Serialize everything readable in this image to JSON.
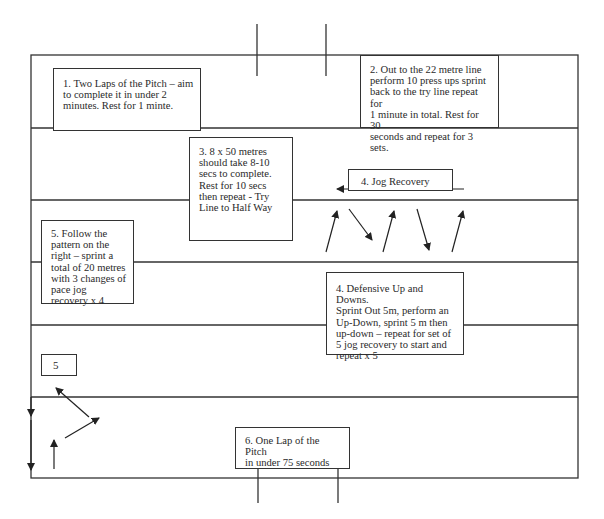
{
  "diagram": {
    "colors": {
      "line": "#333333",
      "background": "#ffffff",
      "text": "#2a2a2a"
    },
    "stations": [
      {
        "id": 1,
        "text": "1. Two Laps of the Pitch – aim\nto complete it in under 2\nminutes. Rest for 1 minte."
      },
      {
        "id": 2,
        "text": "2. Out to the 22 metre line\nperform 10 press ups sprint\nback to the try line repeat for\n1 minute in total. Rest for 30\nseconds and repeat for 3\nsets."
      },
      {
        "id": 3,
        "text": "3. 8  x 50 metres\nshould take 8-10\nsecs to complete.\nRest for 10 secs\nthen repeat  - Try\nLine to Half Way"
      },
      {
        "id": 4,
        "text": "4. Jog Recovery"
      },
      {
        "id": 5,
        "text": "5. Follow the\npattern on the\nright – sprint a\ntotal of 20 metres\nwith 3 changes of\npace jog\nrecovery x 4"
      },
      {
        "id": 6,
        "text": "4. Defensive Up and Downs.\nSprint Out 5m, perform an\nUp-Down, sprint 5 m then\nup-down – repeat for set of\n5 jog recovery to start and\nrepeat x 5"
      },
      {
        "id": 7,
        "text": "5"
      },
      {
        "id": 8,
        "text": "6. One Lap of the Pitch\nin under 75 seconds"
      }
    ],
    "pitch": {
      "outline": {
        "x": 31,
        "y": 55,
        "width": 547,
        "height": 423
      },
      "horizontal_lines_y": [
        128,
        200,
        262,
        325,
        397
      ],
      "goal_posts_top_x": [
        257,
        326
      ],
      "goal_posts_bottom_x": [
        258,
        338
      ]
    },
    "arrows": {
      "jog_recovery": "left-arrow",
      "zigzag": [
        "up-right",
        "down-right",
        "up-right",
        "down-right",
        "up-right"
      ],
      "bottom_left": [
        "down",
        "down",
        "up",
        "up-right",
        "up-left"
      ]
    }
  }
}
